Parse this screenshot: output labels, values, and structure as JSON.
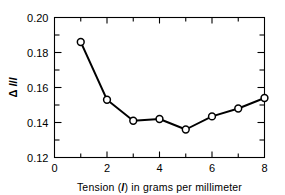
{
  "chart_data": {
    "type": "line",
    "title": "",
    "xlabel": "Tension (l) in grams per millimeter",
    "xlabel_prefix": "Tension (",
    "xlabel_symbol": "l",
    "xlabel_suffix": ") in grams per millimeter",
    "ylabel": "Δ l/l",
    "ylabel_delta": "Δ",
    "ylabel_symbol": "l",
    "ylabel_divider": "/",
    "ylabel_symbol2": "l",
    "x": [
      1,
      2,
      3,
      4,
      5,
      6,
      7,
      8
    ],
    "values": [
      0.186,
      0.153,
      0.141,
      0.142,
      0.136,
      0.1435,
      0.148,
      0.154
    ],
    "xlim": [
      0,
      8
    ],
    "ylim": [
      0.12,
      0.2
    ],
    "xticks_major": [
      0,
      2,
      4,
      6,
      8
    ],
    "xticks_major_labels": [
      "0",
      "2",
      "4",
      "6",
      "8"
    ],
    "xticks_minor": [
      1,
      3,
      5,
      7
    ],
    "yticks_major": [
      0.12,
      0.14,
      0.16,
      0.18,
      0.2
    ],
    "yticks_major_labels": [
      "0.12",
      "0.14",
      "0.16",
      "0.18",
      "0.20"
    ],
    "yticks_minor": [
      0.13,
      0.15,
      0.17,
      0.19
    ],
    "grid": false,
    "legend": false,
    "marker": "open-circle",
    "line_color": "#000000",
    "marker_face_color": "#ffffff",
    "marker_edge_color": "#000000",
    "background_color": "#ffffff"
  }
}
